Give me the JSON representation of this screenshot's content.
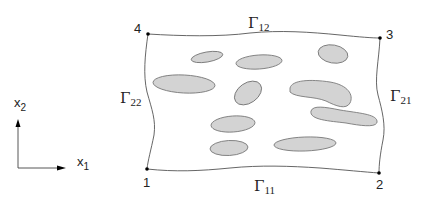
{
  "diagram": {
    "type": "domain-with-inclusions",
    "corners": [
      {
        "label": "1",
        "x": 147,
        "y": 169
      },
      {
        "label": "2",
        "x": 379,
        "y": 173
      },
      {
        "label": "3",
        "x": 380,
        "y": 38
      },
      {
        "label": "4",
        "x": 148,
        "y": 34
      }
    ],
    "boundaries": {
      "bottom": {
        "symbol": "Γ",
        "sub": "11"
      },
      "top": {
        "symbol": "Γ",
        "sub": "12"
      },
      "right": {
        "symbol": "Γ",
        "sub": "21"
      },
      "left": {
        "symbol": "Γ",
        "sub": "22"
      }
    },
    "axes": {
      "x": {
        "base": "x",
        "sub": "1"
      },
      "y": {
        "base": "x",
        "sub": "2"
      }
    },
    "colors": {
      "inclusion_fill": "#d3d3d3",
      "inclusion_stroke": "#7a7a7a",
      "boundary_stroke": "#555555",
      "text": "#222222"
    },
    "inclusions_count": 10
  }
}
